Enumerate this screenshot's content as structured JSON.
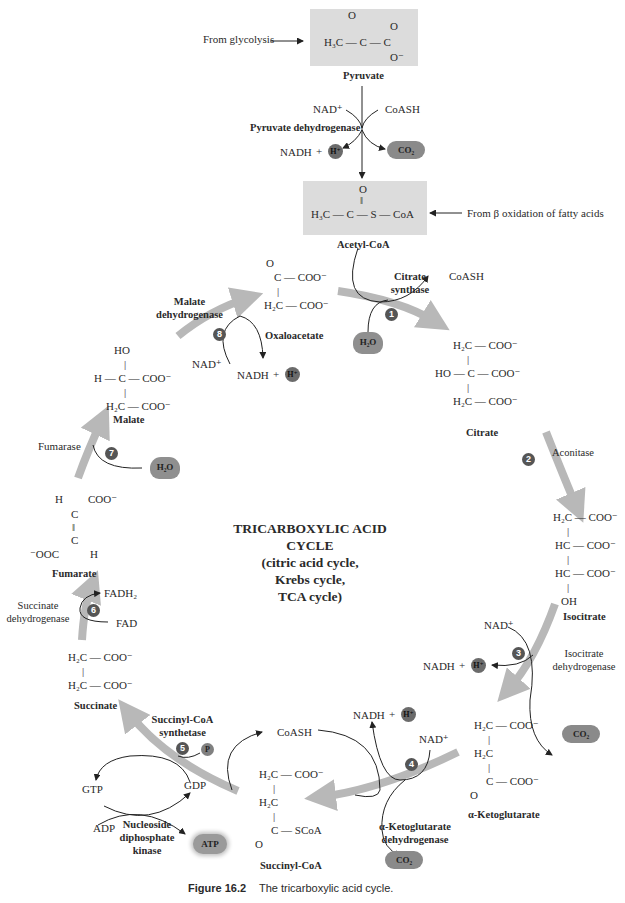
{
  "title": {
    "line1": "TRICARBOXYLIC ACID",
    "line2": "CYCLE",
    "line3": "(citric acid cycle,",
    "line4": "Krebs cycle,",
    "line5": "TCA cycle)"
  },
  "caption": {
    "figure": "Figure 16.2",
    "text": "The tricarboxylic acid cycle."
  },
  "inputs": {
    "from_glycolysis": "From glycolysis",
    "from_beta_oxidation": "From β oxidation of fatty acids"
  },
  "molecules": {
    "pyruvate": {
      "name": "Pyruvate",
      "lines": [
        "O",
        "H₃C — C — C",
        "O⁻"
      ]
    },
    "acetyl_coa": {
      "name": "Acetyl-CoA",
      "lines": [
        "O",
        "‖",
        "H₃C — C — S — CoA"
      ]
    },
    "oxaloacetate": {
      "name": "Oxaloacetate",
      "lines": [
        "O",
        "C — COO⁻",
        "|",
        "H₂C — COO⁻"
      ]
    },
    "citrate": {
      "name": "Citrate",
      "lines": [
        "H₂C — COO⁻",
        "|",
        "HO — C — COO⁻",
        "|",
        "H₂C — COO⁻"
      ]
    },
    "isocitrate": {
      "name": "Isocitrate",
      "lines": [
        "H₂C — COO⁻",
        "|",
        "HC — COO⁻",
        "|",
        "HC — COO⁻",
        "|",
        "OH"
      ]
    },
    "alpha_ketoglutarate": {
      "name": "α-Ketoglutarate",
      "lines": [
        "H₂C — COO⁻",
        "|",
        "H₂C",
        "|",
        "C — COO⁻",
        "O"
      ]
    },
    "succinyl_coa": {
      "name": "Succinyl-CoA",
      "lines": [
        "H₂C — COO⁻",
        "|",
        "H₂C",
        "|",
        "C — SCoA",
        "O"
      ]
    },
    "succinate": {
      "name": "Succinate",
      "lines": [
        "H₂C — COO⁻",
        "|",
        "H₂C — COO⁻"
      ]
    },
    "fumarate": {
      "name": "Fumarate",
      "lines": [
        "H       COO⁻",
        "C",
        "‖",
        "C",
        "⁻OOC       H"
      ]
    },
    "malate": {
      "name": "Malate",
      "lines": [
        "HO",
        "|",
        "H — C — COO⁻",
        "|",
        "H₂C — COO⁻"
      ]
    }
  },
  "enzymes": {
    "pyruvate_dh": "Pyruvate dehydrogenase",
    "citrate_synthase": [
      "Citrate",
      "synthase"
    ],
    "aconitase": "Aconitase",
    "isocitrate_dh": [
      "Isocitrate",
      "dehydrogenase"
    ],
    "akg_dh": [
      "α-Ketoglutarate",
      "dehydrogenase"
    ],
    "succinyl_coa_synthetase": [
      "Succinyl-CoA",
      "synthetase"
    ],
    "ndk": [
      "Nucleoside",
      "diphosphate",
      "kinase"
    ],
    "succinate_dh": [
      "Succinate",
      "dehydrogenase"
    ],
    "fumarase": "Fumarase",
    "malate_dh": [
      "Malate",
      "dehydrogenase"
    ]
  },
  "steps": [
    "1",
    "2",
    "3",
    "4",
    "5",
    "6",
    "7",
    "8"
  ],
  "cofactors": {
    "nad": "NAD⁺",
    "nadh": "NADH",
    "plus": "+",
    "hplus": "H⁺",
    "coash": "CoASH",
    "co2": "CO₂",
    "h2o": "H₂O",
    "fad": "FAD",
    "fadh2": "FADH₂",
    "gdp": "GDP",
    "gtp": "GTP",
    "adp": "ADP",
    "atp": "ATP",
    "p": "P"
  },
  "colors": {
    "cycle_arrow": "#b8b8b8",
    "box": "#dcdcdc",
    "badge": "#555555"
  }
}
